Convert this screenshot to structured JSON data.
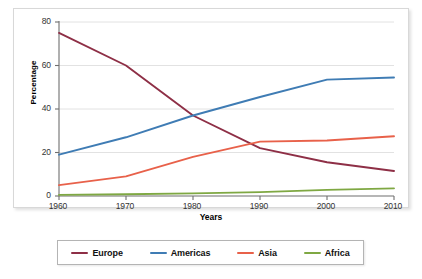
{
  "chart_data": {
    "type": "line",
    "title": "",
    "xlabel": "Years",
    "ylabel": "Percentage",
    "x": [
      1960,
      1970,
      1980,
      1990,
      2000,
      2010
    ],
    "xticklabels": [
      "1960",
      "1970",
      "1980",
      "1990",
      "2000",
      "2010"
    ],
    "yticklabels": [
      "0",
      "20",
      "40",
      "60",
      "80"
    ],
    "yticks": [
      0,
      20,
      40,
      60,
      80
    ],
    "xlim": [
      1960,
      2010
    ],
    "ylim": [
      0,
      80
    ],
    "grid": "horizontal",
    "legend_position": "bottom",
    "series": [
      {
        "name": "Europe",
        "color": "#8e2f46",
        "values": [
          75,
          60,
          37,
          22,
          15.5,
          11.5
        ]
      },
      {
        "name": "Americas",
        "color": "#3f7cb4",
        "values": [
          19,
          27,
          37,
          45.5,
          53.5,
          54.5
        ]
      },
      {
        "name": "Asia",
        "color": "#e8614a",
        "values": [
          5,
          9,
          18,
          25,
          25.5,
          27.5
        ]
      },
      {
        "name": "Africa",
        "color": "#7fa843",
        "values": [
          0.5,
          0.8,
          1.2,
          1.8,
          2.8,
          3.5
        ]
      }
    ]
  },
  "legend": {
    "entries": [
      {
        "label": "Europe"
      },
      {
        "label": "Americas"
      },
      {
        "label": "Asia"
      },
      {
        "label": "Africa"
      }
    ]
  }
}
